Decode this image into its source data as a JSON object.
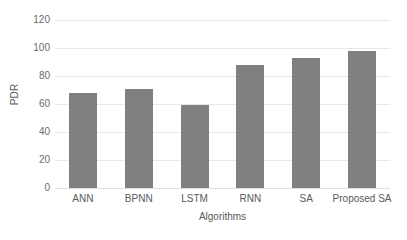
{
  "chart_data": {
    "type": "bar",
    "title": "",
    "subtitle": "",
    "xlabel": "Algorithms",
    "ylabel": "PDR",
    "categories": [
      "ANN",
      "BPNN",
      "LSTM",
      "RNN",
      "SA",
      "Proposed SA"
    ],
    "values": [
      68,
      70.5,
      59.5,
      88,
      93,
      98
    ],
    "series": [
      {
        "name": "PDR",
        "values": [
          68,
          70.5,
          59.5,
          88,
          93,
          98
        ]
      }
    ],
    "ylim": [
      0,
      120
    ],
    "y_ticks": [
      0,
      20,
      40,
      60,
      80,
      100,
      120
    ],
    "y_tick_labels": [
      "0",
      "20",
      "40",
      "60",
      "80",
      "100",
      "120"
    ],
    "grid": "horizontal",
    "legend": "none",
    "legend_position": "none",
    "bar_color": "#808080",
    "gridline_color": "#e8e8e8",
    "text_color": "#595959",
    "background_color": "#ffffff",
    "annotations": []
  }
}
